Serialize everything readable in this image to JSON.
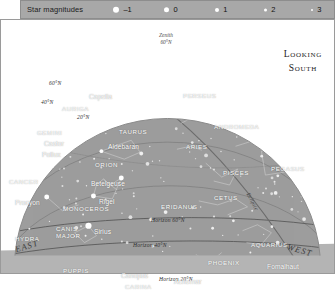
{
  "legend": {
    "title": "Star magnitudes",
    "items": [
      {
        "label": "–1",
        "size": 6.4,
        "x": 92
      },
      {
        "label": "0",
        "size": 5.4,
        "x": 143
      },
      {
        "label": "1",
        "size": 4.2,
        "x": 194
      },
      {
        "label": "2",
        "size": 3.2,
        "x": 243
      },
      {
        "label": "3",
        "size": 2.2,
        "x": 290
      }
    ]
  },
  "heading": {
    "line1": "Looking",
    "line2": "South"
  },
  "zenith": {
    "line1": "Zenith",
    "line2": "60°N"
  },
  "altitude_arcs": [
    {
      "label": "60°N",
      "x": 48,
      "y": 61
    },
    {
      "label": "40°N",
      "x": 40,
      "y": 80
    },
    {
      "label": "20°N",
      "x": 76,
      "y": 95
    }
  ],
  "horizon_lines": [
    {
      "label": "Horizon 60°N",
      "x": 150,
      "y": 198
    },
    {
      "label": "Horizon 40°N",
      "x": 132,
      "y": 223
    },
    {
      "label": "Horizon 20°N",
      "x": 158,
      "y": 257
    }
  ],
  "ecliptic_label": "Ecliptic",
  "corners": {
    "east": "EAST",
    "west": "WEST"
  },
  "constellations": [
    {
      "name": "AURIGA",
      "x": 61,
      "y": 86
    },
    {
      "name": "GEMINI",
      "x": 36,
      "y": 110
    },
    {
      "name": "TAURUS",
      "x": 118,
      "y": 109
    },
    {
      "name": "PERSEUS",
      "x": 182,
      "y": 73
    },
    {
      "name": "ANDROMEDA",
      "x": 213,
      "y": 104
    },
    {
      "name": "ARIES",
      "x": 185,
      "y": 124
    },
    {
      "name": "PISCES",
      "x": 222,
      "y": 150
    },
    {
      "name": "PEGASUS",
      "x": 270,
      "y": 146
    },
    {
      "name": "CETUS",
      "x": 213,
      "y": 175
    },
    {
      "name": "ORION",
      "x": 94,
      "y": 142
    },
    {
      "name": "ERIDANUS",
      "x": 160,
      "y": 184
    },
    {
      "name": "MONOCEROS",
      "x": 62,
      "y": 186
    },
    {
      "name": "CANCER",
      "x": 8,
      "y": 159
    },
    {
      "name": "HYDRA",
      "x": 14,
      "y": 216
    },
    {
      "name": "CANIS",
      "x": 55,
      "y": 206
    },
    {
      "name": "MAJOR",
      "x": 55,
      "y": 213
    },
    {
      "name": "PUPPIS",
      "x": 62,
      "y": 248
    },
    {
      "name": "CARINA",
      "x": 124,
      "y": 264
    },
    {
      "name": "AQUARIUS",
      "x": 250,
      "y": 222
    },
    {
      "name": "PHOENIX",
      "x": 207,
      "y": 240
    }
  ],
  "stars": [
    {
      "name": "Capella",
      "x": 88,
      "y": 74,
      "mag": -1,
      "sx": 118,
      "sy": 72
    },
    {
      "name": "Aldebaran",
      "x": 107,
      "y": 124,
      "mag": 1,
      "sx": 101,
      "sy": 132
    },
    {
      "name": "Castor",
      "x": 43,
      "y": 121,
      "mag": 1,
      "sx": 37,
      "sy": 128
    },
    {
      "name": "Pollux",
      "x": 41,
      "y": 132,
      "mag": 1,
      "sx": 35,
      "sy": 139
    },
    {
      "name": "Betelgeuse",
      "x": 90,
      "y": 161,
      "mag": 0,
      "sx": 121,
      "sy": 159
    },
    {
      "name": "Rigel",
      "x": 98,
      "y": 179,
      "mag": 0,
      "sx": 93,
      "sy": 177
    },
    {
      "name": "Procyon",
      "x": 14,
      "y": 180,
      "mag": 0,
      "sx": 46,
      "sy": 178
    },
    {
      "name": "Sirius",
      "x": 93,
      "y": 209,
      "mag": -1,
      "sx": 88,
      "sy": 207
    },
    {
      "name": "Canopus",
      "x": 120,
      "y": 253,
      "mag": -1,
      "sx": 114,
      "sy": 251
    },
    {
      "name": "Achernar",
      "x": 173,
      "y": 259,
      "mag": 1,
      "sx": 206,
      "sy": 257
    },
    {
      "name": "Fomalhaut",
      "x": 266,
      "y": 244,
      "mag": 1,
      "sx": 261,
      "sy": 252
    }
  ]
}
